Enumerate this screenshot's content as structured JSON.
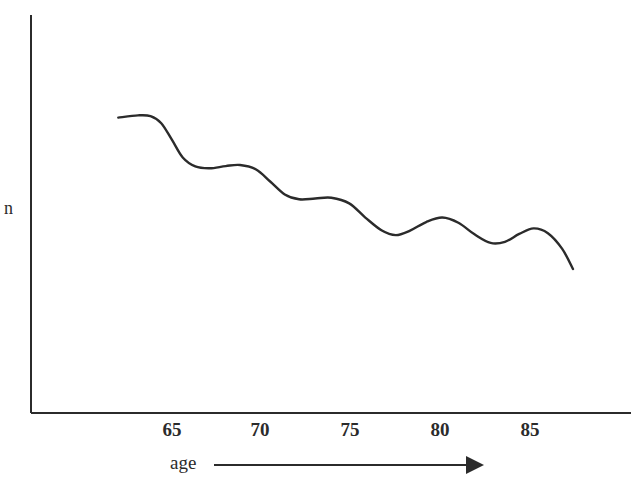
{
  "figure": {
    "width": 631,
    "height": 485,
    "background_color": "#ffffff",
    "ink_color": "#2b2b2b"
  },
  "axes": {
    "y_axis_label": "n",
    "x_axis_caption": "age",
    "x_axis_arrow": "right-arrow",
    "x_tick_labels": [
      "65",
      "70",
      "75",
      "80",
      "85"
    ],
    "y_tick_labels": []
  },
  "chart_data": {
    "type": "line",
    "title": "",
    "subtitle": "",
    "xlabel": "age",
    "ylabel": "n",
    "grid": false,
    "legend": null,
    "legend_position": "none",
    "axis_style": "open-left-bottom-spines",
    "xlim": [
      62,
      87.5
    ],
    "ylim": [
      0,
      100
    ],
    "xticks": [
      65,
      70,
      75,
      80,
      85
    ],
    "yticks": [],
    "annotations": [
      "age axis terminates in a rightward arrow",
      "y axis is unlabeled apart from the symbol n"
    ],
    "series": [
      {
        "name": "n vs age",
        "color": "#2b2b2b",
        "x": [
          62.0,
          63.1,
          63.8,
          64.4,
          65.0,
          65.6,
          66.3,
          67.1,
          68.0,
          68.8,
          69.7,
          70.5,
          71.3,
          72.1,
          73.0,
          73.9,
          74.9,
          75.8,
          76.7,
          77.5,
          78.3,
          79.2,
          80.1,
          81.0,
          81.9,
          82.8,
          83.6,
          84.4,
          85.2,
          86.0,
          86.8,
          87.4
        ],
        "y": [
          79.2,
          79.8,
          79.6,
          77.7,
          73.2,
          68.5,
          66.1,
          65.6,
          66.2,
          66.5,
          65.3,
          62.0,
          58.6,
          57.3,
          57.5,
          57.7,
          56.2,
          52.4,
          49.0,
          47.7,
          48.9,
          51.2,
          52.4,
          51.0,
          47.9,
          45.6,
          45.9,
          48.0,
          49.5,
          48.2,
          44.0,
          38.6
        ]
      }
    ]
  }
}
